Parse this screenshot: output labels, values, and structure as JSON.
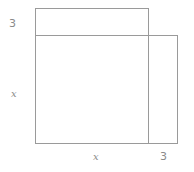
{
  "diagram": {
    "labels": {
      "top_strip_height": "3",
      "square_side_left": "x",
      "square_side_bottom": "x",
      "right_strip_width": "3"
    },
    "colors": {
      "stroke": "#9a9a9a",
      "label": "#8a8a8a"
    }
  }
}
